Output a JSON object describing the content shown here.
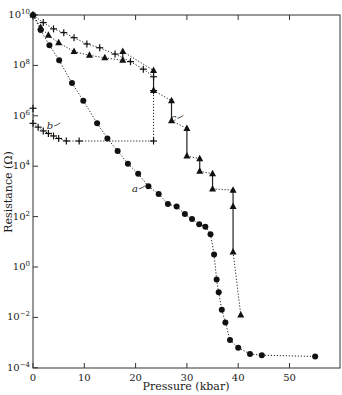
{
  "chart_data": {
    "type": "scatter",
    "title": "",
    "xlabel": "Pressure (kbar)",
    "ylabel": "Resistance (Ω)",
    "xlim": [
      0,
      60
    ],
    "ylim_log10": [
      -4,
      10
    ],
    "yscale": "log",
    "x_ticks": [
      0,
      10,
      20,
      30,
      40,
      50
    ],
    "y_ticks": [
      "10^10",
      "10^8",
      "10^6",
      "10^4",
      "10^2",
      "10^0",
      "10^-2",
      "10^-4"
    ],
    "grid": false,
    "legend": "none (curves labeled a, b, c directly)",
    "series": [
      {
        "name": "a",
        "marker": "circle",
        "line": "dotted",
        "points_log10": [
          [
            0,
            10
          ],
          [
            1.5,
            9.4
          ],
          [
            3.2,
            8.8
          ],
          [
            5.1,
            8.2
          ],
          [
            7.6,
            7.3
          ],
          [
            9.8,
            6.6
          ],
          [
            12.5,
            5.7
          ],
          [
            14.5,
            5.1
          ],
          [
            16.5,
            4.6
          ],
          [
            18.5,
            4.1
          ],
          [
            20.5,
            3.7
          ],
          [
            22.5,
            3.2
          ],
          [
            24.5,
            2.9
          ],
          [
            26.3,
            2.5
          ],
          [
            28.0,
            2.4
          ],
          [
            29.6,
            2.1
          ],
          [
            31.0,
            1.9
          ],
          [
            32.4,
            1.7
          ],
          [
            33.6,
            1.6
          ],
          [
            34.6,
            1.3
          ],
          [
            35.3,
            0.5
          ],
          [
            35.8,
            -0.5
          ],
          [
            36.2,
            -1.0
          ],
          [
            36.8,
            -1.7
          ],
          [
            37.5,
            -2.2
          ],
          [
            38.4,
            -2.9
          ],
          [
            40.0,
            -3.2
          ],
          [
            42.3,
            -3.45
          ],
          [
            44.6,
            -3.5
          ],
          [
            55.0,
            -3.55
          ]
        ]
      },
      {
        "name": "b",
        "marker": "cross",
        "line": "dotted",
        "points_log10": [
          [
            0,
            6.3
          ],
          [
            0,
            5.7
          ],
          [
            1,
            5.55
          ],
          [
            2,
            5.4
          ],
          [
            3,
            5.3
          ],
          [
            4,
            5.2
          ],
          [
            5,
            5.1
          ],
          [
            6.5,
            5.0
          ],
          [
            9,
            5.0
          ],
          [
            23.5,
            5.0
          ],
          [
            23.5,
            7.0
          ]
        ]
      },
      {
        "name": "c",
        "marker": "triangle",
        "line": "dotted with solid vertical steps",
        "points_log10": [
          [
            0,
            10
          ],
          [
            1.5,
            9.5
          ],
          [
            3,
            9.2
          ],
          [
            5,
            8.9
          ],
          [
            8,
            8.55
          ],
          [
            11,
            8.4
          ],
          [
            14,
            8.3
          ],
          [
            17.5,
            8.2
          ],
          [
            17.5,
            8.55
          ],
          [
            23.5,
            7.8
          ],
          [
            23.5,
            7.0
          ],
          [
            27,
            6.6
          ],
          [
            27,
            5.8
          ],
          [
            30,
            5.5
          ],
          [
            30,
            4.4
          ],
          [
            32.5,
            4.3
          ],
          [
            32.5,
            3.8
          ],
          [
            35,
            3.7
          ],
          [
            35,
            3.1
          ],
          [
            39,
            3.05
          ],
          [
            39,
            2.4
          ],
          [
            39,
            0.6
          ],
          [
            40.5,
            -1.9
          ]
        ]
      },
      {
        "name": "upper crosses",
        "marker": "cross",
        "line": "dotted",
        "points_log10": [
          [
            0,
            10
          ],
          [
            2,
            9.7
          ],
          [
            4,
            9.45
          ],
          [
            6,
            9.3
          ],
          [
            8,
            9.1
          ],
          [
            10.5,
            8.85
          ],
          [
            13,
            8.7
          ],
          [
            16,
            8.45
          ],
          [
            19,
            8.15
          ],
          [
            21.5,
            7.85
          ],
          [
            23.5,
            7.55
          ]
        ]
      }
    ],
    "annotations": [
      {
        "text": "a",
        "x": 22.0,
        "y_log10": 3.1
      },
      {
        "text": "b",
        "x": 5.5,
        "y_log10": 5.6
      },
      {
        "text": "c",
        "x": 29.5,
        "y_log10": 5.9
      }
    ]
  }
}
